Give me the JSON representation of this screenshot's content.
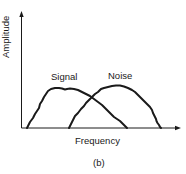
{
  "figure": {
    "caption": "(b)",
    "axes": {
      "xlabel": "Frequency",
      "ylabel": "Amplitude"
    },
    "curves": [
      {
        "name": "signal",
        "label": "Signal"
      },
      {
        "name": "noise",
        "label": "Noise"
      }
    ],
    "colors": {
      "line": "#1a1a1a",
      "background": "#ffffff"
    }
  }
}
